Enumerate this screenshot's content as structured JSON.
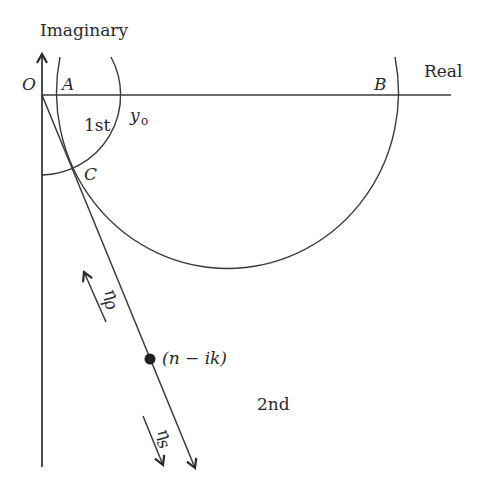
{
  "diagram": {
    "type": "complex-plane admittance diagram",
    "axes": {
      "vertical_label": "Imaginary",
      "horizontal_label": "Real",
      "origin_label": "O"
    },
    "points": {
      "A": "A",
      "B": "B",
      "C": "C",
      "y0_main": "y",
      "y0_sub": "o",
      "material": "(n − ik)"
    },
    "regions": {
      "first": "1st",
      "second": "2nd"
    },
    "arrows": {
      "eta_p_main": "η",
      "eta_p_sub": "ρ",
      "eta_s_main": "η",
      "eta_s_sub": "s"
    },
    "colors": {
      "line": "#3a3a3a",
      "text": "#2a2a2a",
      "background": "#ffffff"
    }
  }
}
